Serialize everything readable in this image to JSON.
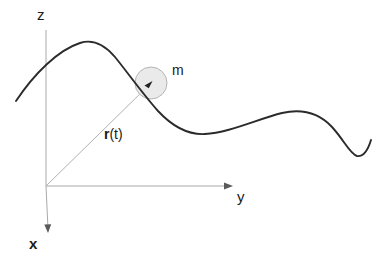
{
  "figure": {
    "type": "physics-kinematics-diagram",
    "background_color": "#ffffff",
    "width": 382,
    "height": 261
  },
  "axes": {
    "origin": {
      "x": 46,
      "y": 186
    },
    "items": [
      {
        "id": "z",
        "label": "z",
        "direction": "up",
        "label_position": {
          "x": 37,
          "y": 7
        },
        "line": {
          "x1": 46,
          "y1": 186,
          "x2": 46,
          "y2": 30
        },
        "color": "#aaaaaa",
        "has_arrowhead": false
      },
      {
        "id": "y",
        "label": "y",
        "direction": "right",
        "label_position": {
          "x": 237,
          "y": 189
        },
        "line": {
          "x1": 46,
          "y1": 186,
          "x2": 231,
          "y2": 186
        },
        "color": "#aaaaaa",
        "has_arrowhead": true
      },
      {
        "id": "x",
        "label": "x",
        "direction": "down-left",
        "label_position": {
          "x": 29,
          "y": 236
        },
        "line": {
          "x1": 46,
          "y1": 186,
          "x2": 48,
          "y2": 230
        },
        "color": "#aaaaaa",
        "has_arrowhead": true
      }
    ]
  },
  "vector": {
    "id": "position-vector",
    "label_bold": "r",
    "label_rest": "(t)",
    "label_plain": "r(t)",
    "label_position": {
      "x": 104,
      "y": 127
    },
    "from": {
      "x": 46,
      "y": 186
    },
    "to": {
      "x": 151,
      "y": 83
    },
    "color": "#b0b0b0",
    "has_arrowhead": true
  },
  "particle": {
    "id": "mass-particle",
    "label": "m",
    "label_position": {
      "x": 172,
      "y": 63
    },
    "center": {
      "x": 151,
      "y": 83
    },
    "radius": 16,
    "fill_color": "#e9e9e9",
    "stroke_color": "#b5b5b5"
  },
  "trajectory": {
    "id": "particle-path",
    "color": "#2b2b2b",
    "stroke_width": 1.9,
    "path": "M 16 101 C 34 74, 58 50, 80 43 C 92 39, 104 44, 115 57 C 128 73, 142 93, 158 111 C 172 126, 188 135, 205 134 C 228 133, 258 119, 282 113 C 300 109, 318 112, 332 127 C 344 140, 350 154, 357 156 C 364 157, 368 150, 371 140",
    "key_points": [
      {
        "name": "start",
        "x": 16,
        "y": 101
      },
      {
        "name": "peak",
        "x": 97,
        "y": 43
      },
      {
        "name": "particle-location",
        "x": 151,
        "y": 83
      },
      {
        "name": "trough",
        "x": 205,
        "y": 134
      },
      {
        "name": "crest",
        "x": 295,
        "y": 113
      },
      {
        "name": "dip",
        "x": 356,
        "y": 156
      },
      {
        "name": "end-hook",
        "x": 371,
        "y": 140
      }
    ]
  }
}
